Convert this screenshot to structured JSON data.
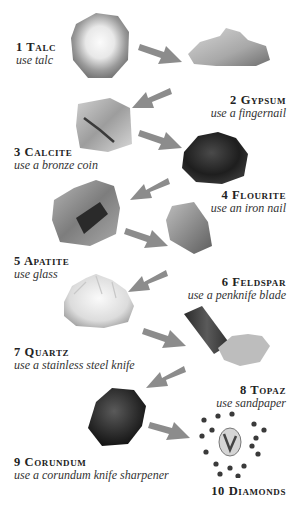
{
  "colors": {
    "arrow": "#8c8c8c",
    "text": "#222222",
    "background": "#ffffff"
  },
  "minerals": [
    {
      "rank": 1,
      "name": "1 Talc",
      "tool": "use talc"
    },
    {
      "rank": 2,
      "name": "2 Gypsum",
      "tool": "use a fingernail"
    },
    {
      "rank": 3,
      "name": "3 Calcite",
      "tool": "use a bronze coin"
    },
    {
      "rank": 4,
      "name": "4 Flourite",
      "tool": "use an iron nail"
    },
    {
      "rank": 5,
      "name": "5 Apatite",
      "tool": "use glass"
    },
    {
      "rank": 6,
      "name": "6 Feldspar",
      "tool": "use a penknife blade"
    },
    {
      "rank": 7,
      "name": "7 Quartz",
      "tool": "use a stainless steel knife"
    },
    {
      "rank": 8,
      "name": "8 Topaz",
      "tool": "use sandpaper"
    },
    {
      "rank": 9,
      "name": "9 Corundum",
      "tool": "use a corundum knife sharpener"
    },
    {
      "rank": 10,
      "name": "10 Diamonds",
      "tool": ""
    }
  ],
  "arrows": [
    {
      "from": 1,
      "to": 2,
      "direction": "down-right"
    },
    {
      "from": 2,
      "to": 3,
      "direction": "down-left"
    },
    {
      "from": 3,
      "to": 4,
      "direction": "down-right"
    },
    {
      "from": 4,
      "to": 5,
      "direction": "down-left"
    },
    {
      "from": 5,
      "to": 6,
      "direction": "down-right"
    },
    {
      "from": 6,
      "to": 7,
      "direction": "down-left"
    },
    {
      "from": 7,
      "to": 8,
      "direction": "down-right"
    },
    {
      "from": 8,
      "to": 9,
      "direction": "down-left"
    },
    {
      "from": 9,
      "to": 10,
      "direction": "down-right"
    }
  ]
}
